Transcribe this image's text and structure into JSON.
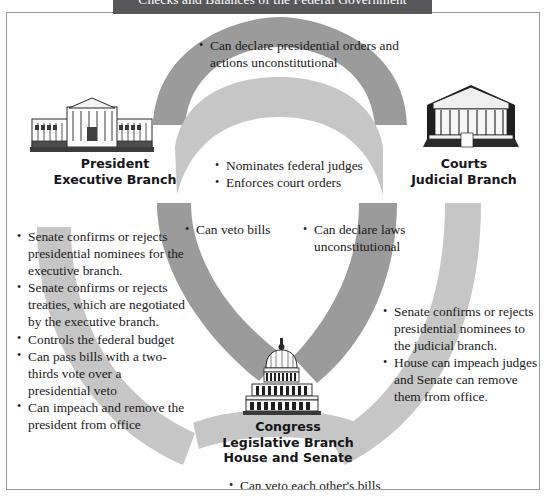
{
  "title": "Checks and Balances of the Federal Government",
  "branches": {
    "president": {
      "icon": "white-house-icon",
      "line1": "President",
      "line2": "Executive Branch"
    },
    "courts": {
      "icon": "supreme-court-icon",
      "line1": "Courts",
      "line2": "Judicial Branch"
    },
    "congress": {
      "icon": "capitol-dome-icon",
      "line1": "Congress",
      "line2": "Legislative Branch",
      "line3": "House and Senate"
    }
  },
  "flows": {
    "courts_over_president": [
      "Can declare presidential orders and actions unconstitutional"
    ],
    "president_over_courts": [
      "Nominates federal judges",
      "Enforces court orders"
    ],
    "president_over_congress": [
      "Can veto bills"
    ],
    "courts_over_congress": [
      "Can declare laws unconstitutional"
    ],
    "congress_over_president": [
      "Senate confirms or rejects presidential nominees for the executive branch.",
      "Senate confirms or rejects treaties, which are negotiated by the executive branch.",
      "Controls the federal budget",
      "Can pass bills with a two-thirds vote over a presidential veto",
      "Can impeach and remove the president from office"
    ],
    "congress_over_courts": [
      "Senate confirms or rejects presidential nominees to the judicial branch.",
      "House can impeach judges and Senate can remove them from office."
    ],
    "congress_internal": [
      "Can veto each other's bills"
    ]
  },
  "colors": {
    "title_band": "#58585a",
    "arc_dark": "#9b9b9b",
    "arc_light": "#c6c6c6",
    "border": "#9a9a9a",
    "text": "#1a1a1a"
  }
}
